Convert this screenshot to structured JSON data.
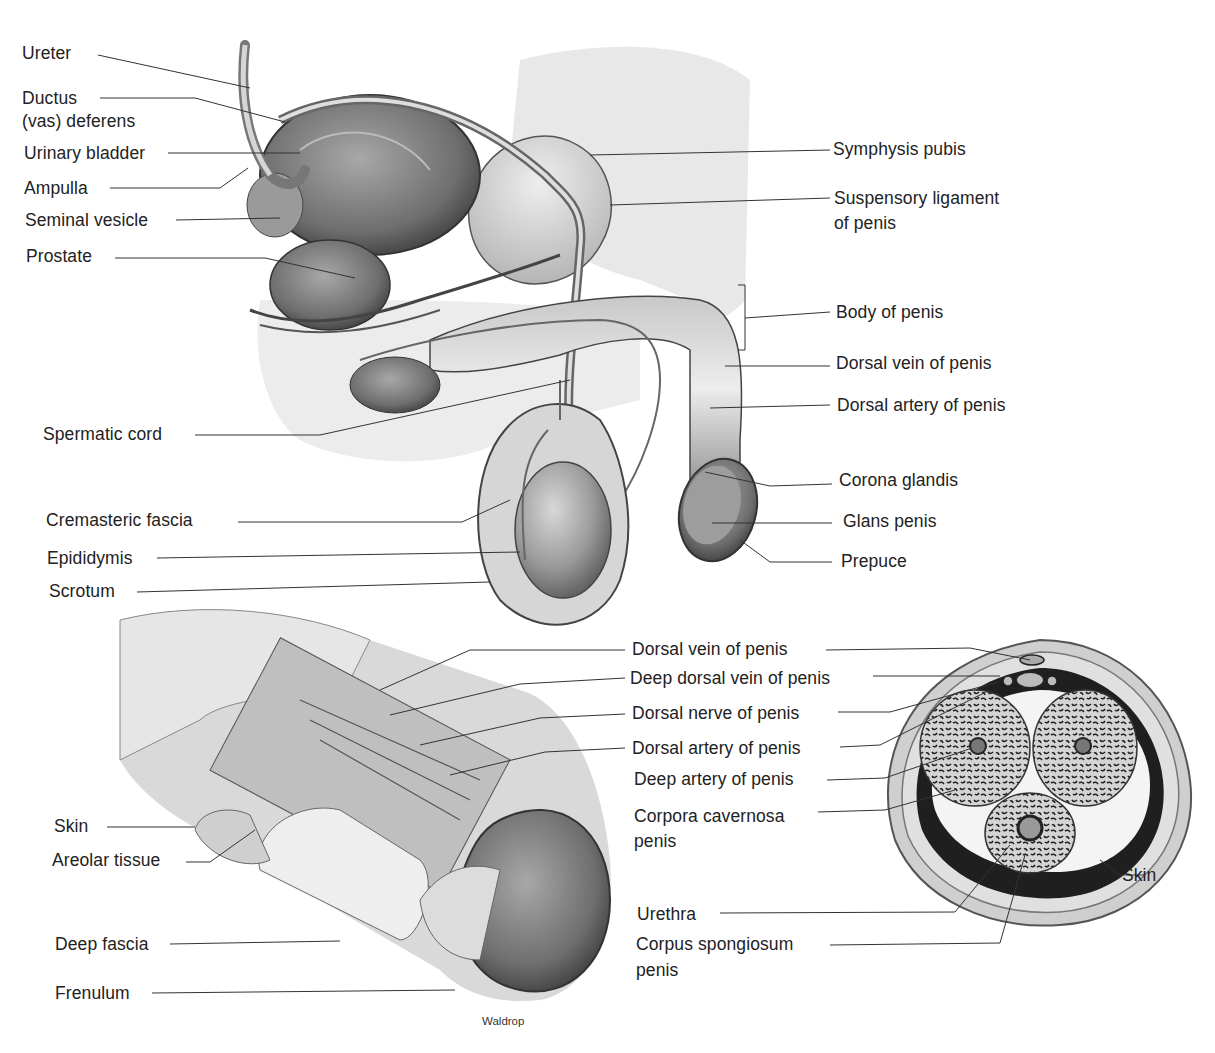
{
  "figure": {
    "credit": "Waldrop",
    "panels": [
      {
        "id": "sagittal-view",
        "labels_left": [
          {
            "text": "Ureter"
          },
          {
            "text": "Ductus",
            "line2": "(vas) deferens"
          },
          {
            "text": "Urinary bladder"
          },
          {
            "text": "Ampulla"
          },
          {
            "text": "Seminal vesicle"
          },
          {
            "text": "Prostate"
          },
          {
            "text": "Spermatic cord"
          },
          {
            "text": "Cremasteric fascia"
          },
          {
            "text": "Epididymis"
          },
          {
            "text": "Scrotum"
          }
        ],
        "labels_right": [
          {
            "text": "Symphysis pubis"
          },
          {
            "text": "Suspensory ligament",
            "line2": "of penis"
          },
          {
            "text": "Body of penis"
          },
          {
            "text": "Dorsal vein of penis"
          },
          {
            "text": "Dorsal artery of penis"
          },
          {
            "text": "Corona glandis"
          },
          {
            "text": "Glans penis"
          },
          {
            "text": "Prepuce"
          }
        ]
      },
      {
        "id": "dissected-shaft-view",
        "labels_left": [
          {
            "text": "Skin"
          },
          {
            "text": "Areolar tissue"
          },
          {
            "text": "Deep fascia"
          },
          {
            "text": "Frenulum"
          }
        ]
      },
      {
        "id": "cross-section-view",
        "labels": [
          {
            "text": "Dorsal vein of penis"
          },
          {
            "text": "Deep dorsal vein of penis"
          },
          {
            "text": "Dorsal nerve of penis"
          },
          {
            "text": "Dorsal artery of penis"
          },
          {
            "text": "Deep artery of penis"
          },
          {
            "text": "Corpora cavernosa",
            "line2": "penis"
          },
          {
            "text": "Skin"
          },
          {
            "text": "Urethra"
          },
          {
            "text": "Corpus spongiosum",
            "line2": "penis"
          }
        ]
      }
    ]
  }
}
